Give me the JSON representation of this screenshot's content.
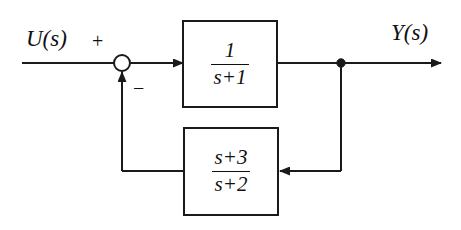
{
  "diagram": {
    "background_color": "#ffffff",
    "line_color": "#1a1a1a",
    "text_color": "#101010",
    "input_signal": {
      "label": "U(s)",
      "sign": "+"
    },
    "output_signal": {
      "label": "Y(s)"
    },
    "summing_junction": {
      "name": "summing-junction",
      "shape": "circle",
      "filled": false,
      "center_x": 122,
      "center_y": 63,
      "radius": 8,
      "feedback_sign": "−"
    },
    "takeoff_point": {
      "name": "signal-takeoff-dot",
      "filled": true,
      "center_x": 341,
      "center_y": 63,
      "radius": 4
    },
    "blocks": [
      {
        "id": "forward-plant",
        "role": "forward path transfer function",
        "numerator": "1",
        "denominator": "s+1",
        "expression": "1/(s+1)",
        "x": 182,
        "y": 20,
        "width": 96,
        "height": 88
      },
      {
        "id": "feedback-element",
        "role": "feedback path transfer function",
        "numerator": "s+3",
        "denominator": "s+2",
        "expression": "(s+3)/(s+2)",
        "x": 183,
        "y": 127,
        "width": 96,
        "height": 89
      }
    ]
  }
}
